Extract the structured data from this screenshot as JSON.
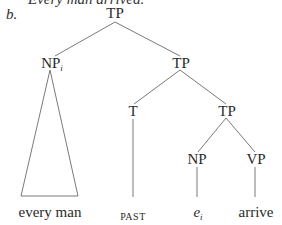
{
  "cutoff_text": "Every man arrived.",
  "example_label": "b.",
  "tree": {
    "root": {
      "label": "TP"
    },
    "np_i": {
      "label": "NP",
      "subscript": "i"
    },
    "tp1": {
      "label": "TP"
    },
    "t": {
      "label": "T"
    },
    "tp2": {
      "label": "TP"
    },
    "np": {
      "label": "NP"
    },
    "vp": {
      "label": "VP"
    },
    "leaves": {
      "every_man": "every man",
      "past": "PAST",
      "e": "e",
      "e_subscript": "i",
      "arrive": "arrive"
    }
  }
}
